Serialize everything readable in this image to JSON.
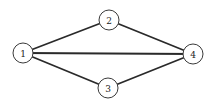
{
  "diagram": {
    "type": "undirected-graph",
    "node_radius": 10,
    "nodes": [
      {
        "id": "1",
        "label": "1",
        "x": 23,
        "y": 53
      },
      {
        "id": "2",
        "label": "2",
        "x": 109,
        "y": 20
      },
      {
        "id": "3",
        "label": "3",
        "x": 108,
        "y": 88
      },
      {
        "id": "4",
        "label": "4",
        "x": 193,
        "y": 54
      }
    ],
    "edges": [
      {
        "from": "1",
        "to": "2"
      },
      {
        "from": "1",
        "to": "4"
      },
      {
        "from": "1",
        "to": "3"
      },
      {
        "from": "2",
        "to": "4"
      },
      {
        "from": "3",
        "to": "4"
      }
    ],
    "colors": {
      "edge": "#2a2a2a",
      "node_stroke": "#3a3a3a",
      "node_fill": "#ffffff",
      "background": "#ffffff"
    }
  }
}
